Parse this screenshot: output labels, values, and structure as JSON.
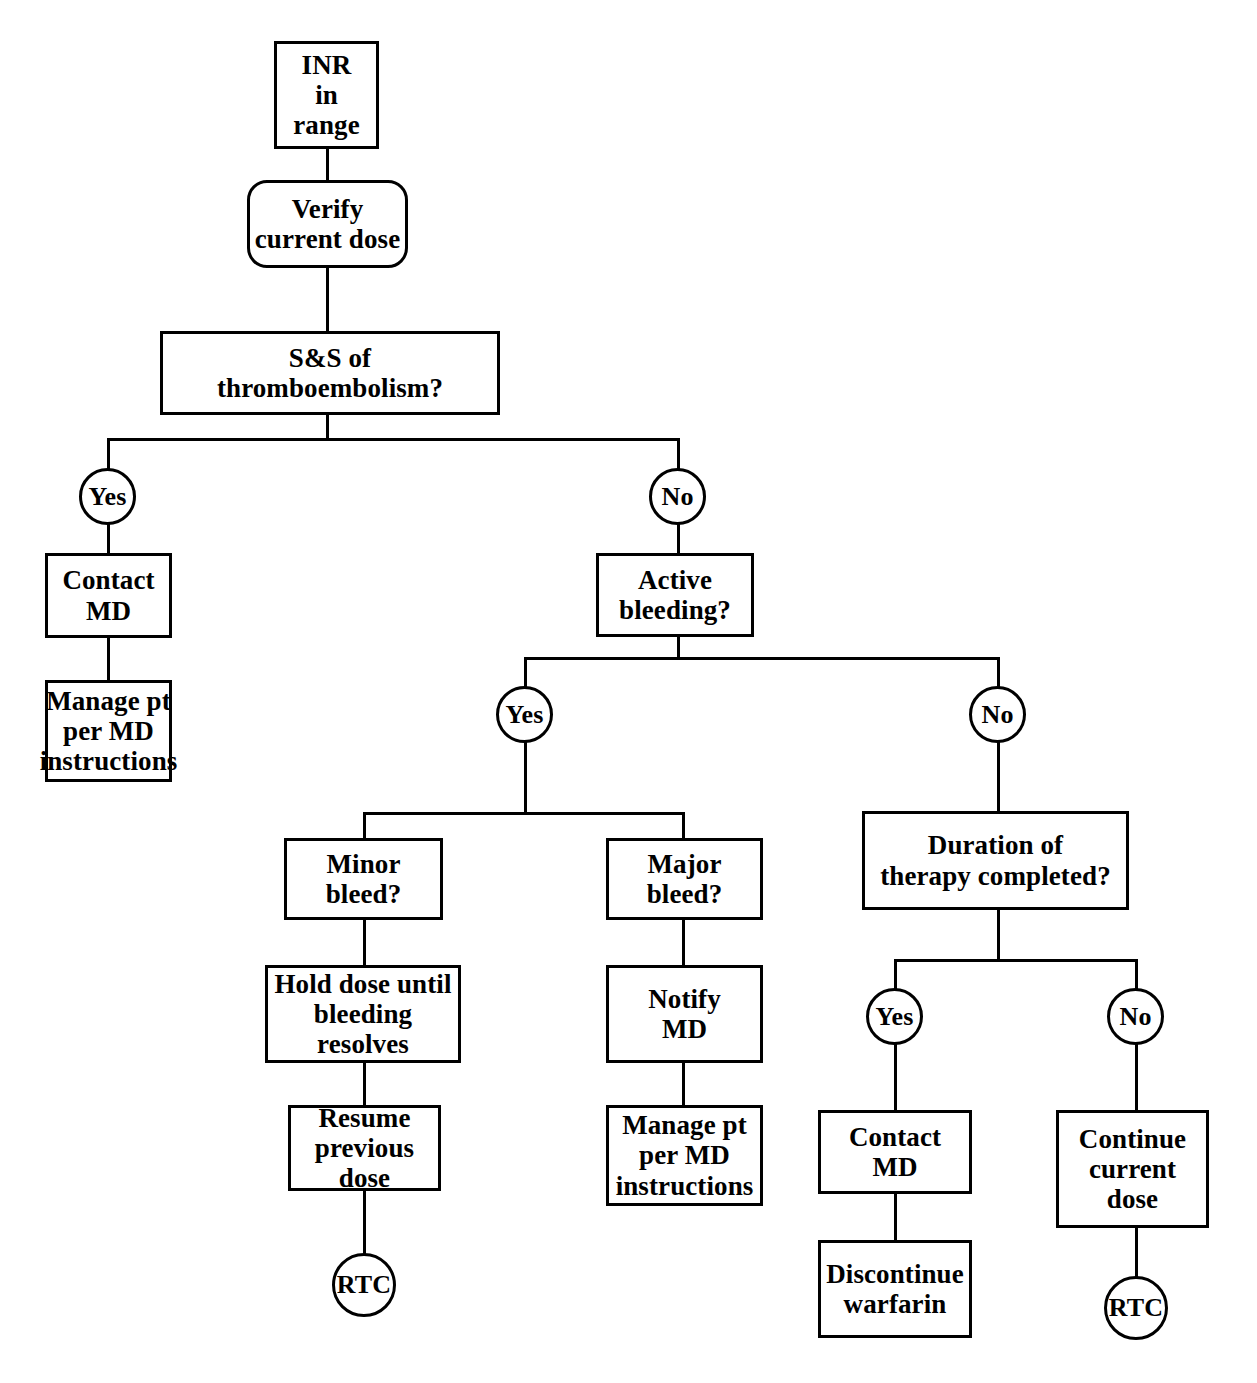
{
  "diagram": {
    "line_color": "#000000",
    "background_color": "#ffffff",
    "nodes": {
      "inr_in_range": "INR\nin\nrange",
      "verify_current_dose": "Verify\ncurrent dose",
      "ss_thromboembolism": "S&S of\nthromboembolism?",
      "ss_yes": "Yes",
      "ss_no": "No",
      "contact_md_left": "Contact\nMD",
      "manage_pt_left": "Manage pt\nper MD\ninstructions",
      "active_bleeding": "Active\nbleeding?",
      "bleeding_yes": "Yes",
      "bleeding_no": "No",
      "minor_bleed": "Minor\nbleed?",
      "major_bleed": "Major\nbleed?",
      "hold_dose": "Hold dose until\nbleeding\nresolves",
      "resume_previous_dose": "Resume\nprevious\ndose",
      "rtc_minor": "RTC",
      "notify_md": "Notify\nMD",
      "manage_pt_major": "Manage pt\nper MD\ninstructions",
      "duration_of_therapy": "Duration of\ntherapy completed?",
      "duration_yes": "Yes",
      "duration_no": "No",
      "contact_md_duration": "Contact\nMD",
      "discontinue_warfarin": "Discontinue\nwarfarin",
      "continue_current_dose": "Continue\ncurrent\ndose",
      "rtc_duration": "RTC"
    }
  }
}
